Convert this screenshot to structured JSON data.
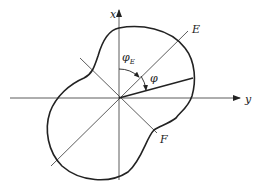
{
  "diagram": {
    "type": "polar-shape-with-axes",
    "axes": {
      "vertical_label": "x",
      "horizontal_label": "y"
    },
    "lines": {
      "principal_1_label": "E",
      "principal_2_label": "F"
    },
    "angles": {
      "angle_from_x_to_E": "φ",
      "angle_from_x_to_E_subscript": "E",
      "angle_from_E_to_ray": "φ"
    },
    "colors": {
      "stroke": "#222222",
      "background": "#ffffff"
    }
  }
}
